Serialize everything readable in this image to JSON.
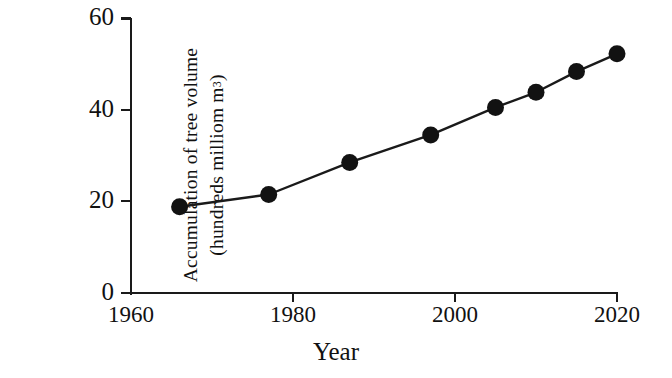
{
  "chart_data": {
    "type": "line",
    "title": "",
    "xlabel": "Year",
    "ylabel_line1": "Accumulation  of tree volume",
    "ylabel_line2_pre": "(hundreds milliom m",
    "ylabel_line2_sup": "3",
    "ylabel_line2_post": ")",
    "ylabel": "Accumulation of tree volume (hundreds milliom m3)",
    "x": [
      1966,
      1977,
      1987,
      1997,
      2005,
      2010,
      2015,
      2020
    ],
    "values": [
      18.8,
      21.5,
      28.5,
      34.5,
      40.5,
      43.8,
      48.3,
      52.2
    ],
    "series": [
      {
        "name": "Accumulation of tree volume",
        "values": [
          18.8,
          21.5,
          28.5,
          34.5,
          40.5,
          43.8,
          48.3,
          52.2
        ]
      }
    ],
    "xlim": [
      1960,
      2020
    ],
    "ylim": [
      0,
      60
    ],
    "xticks": [
      1960,
      1980,
      2000,
      2020
    ],
    "xtick_labels": [
      "1960",
      "1980",
      "2000",
      "2020"
    ],
    "yticks": [
      0,
      20,
      40,
      60
    ],
    "ytick_labels": [
      "0",
      "20",
      "40",
      "60"
    ],
    "grid": false,
    "legend": false,
    "marker": "filled-circle",
    "marker_color": "#121212",
    "line_color": "#1a1a1a",
    "background_color": "#ffffff"
  }
}
